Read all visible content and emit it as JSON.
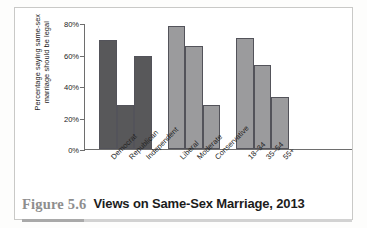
{
  "figure": {
    "number_label": "Figure 5.6",
    "title": "Views on Same-Sex Marriage, 2013"
  },
  "colors": {
    "group_party_bar": "#58585a",
    "group_ideology_bar": "#9b9b9d",
    "group_age_bar": "#9b9b9d",
    "bar_outline": "#53535a",
    "axis": "#6e6e6e",
    "figure_number_text": "#8e8e8e",
    "title_text": "#1c1c1c",
    "rule": "#d2d2d2"
  },
  "chart_data": {
    "type": "bar",
    "title": "Views on Same-Sex Marriage, 2013",
    "xlabel": "",
    "ylabel": "Percentage saying same-sex marriage should be legal",
    "ylim": [
      0,
      80
    ],
    "yticks": [
      0,
      20,
      40,
      60,
      80
    ],
    "ytick_labels": [
      "0%",
      "20%",
      "40%",
      "60%",
      "80%"
    ],
    "grid": false,
    "legend": false,
    "categories": [
      "Democrat",
      "Republican",
      "Independent",
      "Liberal",
      "Moderate",
      "Conservative",
      "18–34",
      "35–54",
      "55+"
    ],
    "values": [
      69,
      28,
      59,
      78,
      65,
      28,
      70,
      53,
      33
    ],
    "groups": [
      {
        "name": "Party identification",
        "color": "#58585a",
        "bars": [
          {
            "label": "Democrat",
            "value": 69
          },
          {
            "label": "Republican",
            "value": 28
          },
          {
            "label": "Independent",
            "value": 59
          }
        ]
      },
      {
        "name": "Ideology",
        "color": "#9b9b9d",
        "bars": [
          {
            "label": "Liberal",
            "value": 78
          },
          {
            "label": "Moderate",
            "value": 65
          },
          {
            "label": "Conservative",
            "value": 28
          }
        ]
      },
      {
        "name": "Age group",
        "color": "#9b9b9d",
        "bars": [
          {
            "label": "18–34",
            "value": 70
          },
          {
            "label": "35–54",
            "value": 53
          },
          {
            "label": "55+",
            "value": 33
          }
        ]
      }
    ]
  }
}
